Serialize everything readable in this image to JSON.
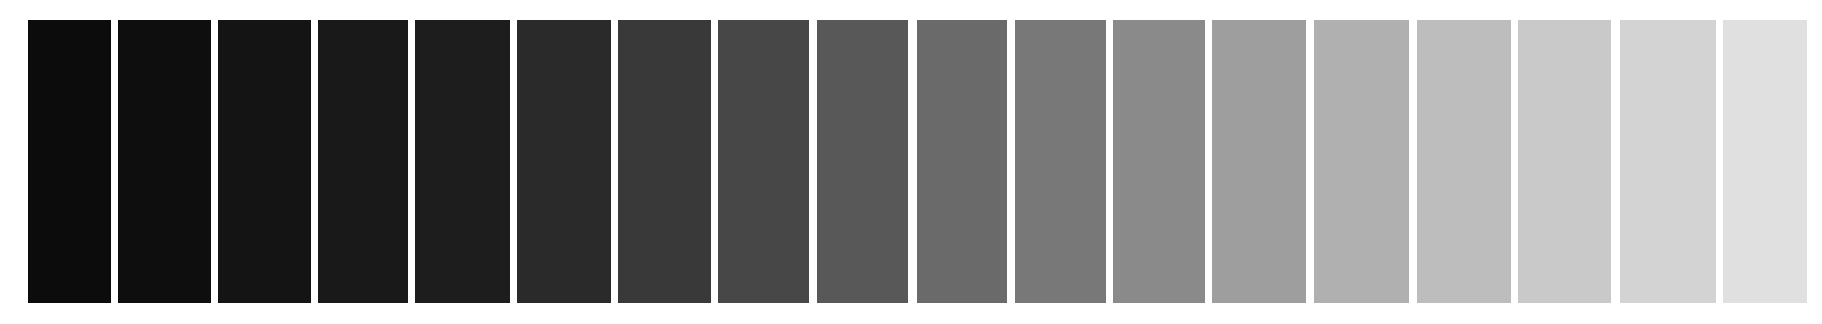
{
  "background": "#ffffff",
  "steps": [
    {
      "index": 1,
      "x": 28,
      "width": 83,
      "color": "#0c0c0c"
    },
    {
      "index": 2,
      "x": 118,
      "width": 93,
      "color": "#0e0e0e"
    },
    {
      "index": 3,
      "x": 218,
      "width": 93,
      "color": "#141414"
    },
    {
      "index": 4,
      "x": 318,
      "width": 90,
      "color": "#191919"
    },
    {
      "index": 5,
      "x": 415,
      "width": 95,
      "color": "#1d1d1d"
    },
    {
      "index": 6,
      "x": 517,
      "width": 94,
      "color": "#2a2a2a"
    },
    {
      "index": 7,
      "x": 618,
      "width": 93,
      "color": "#393939"
    },
    {
      "index": 8,
      "x": 718,
      "width": 91,
      "color": "#474747"
    },
    {
      "index": 9,
      "x": 817,
      "width": 91,
      "color": "#585858"
    },
    {
      "index": 10,
      "x": 917,
      "width": 90,
      "color": "#6a6a6a"
    },
    {
      "index": 11,
      "x": 1015,
      "width": 91,
      "color": "#787878"
    },
    {
      "index": 12,
      "x": 1113,
      "width": 92,
      "color": "#8a8a8a"
    },
    {
      "index": 13,
      "x": 1212,
      "width": 94,
      "color": "#9e9e9e"
    },
    {
      "index": 14,
      "x": 1314,
      "width": 95,
      "color": "#b0b0b0"
    },
    {
      "index": 15,
      "x": 1417,
      "width": 94,
      "color": "#bdbdbd"
    },
    {
      "index": 16,
      "x": 1518,
      "width": 93,
      "color": "#c9c9c9"
    },
    {
      "index": 17,
      "x": 1620,
      "width": 96,
      "color": "#d3d3d3"
    },
    {
      "index": 18,
      "x": 1723,
      "width": 84,
      "color": "#e0e0e0"
    }
  ]
}
